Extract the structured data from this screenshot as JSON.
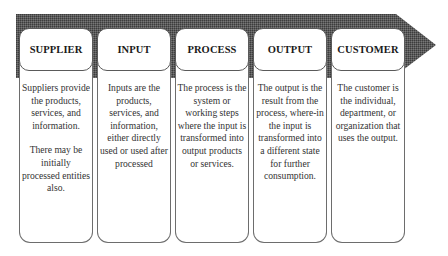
{
  "diagram": {
    "type": "SIPOC process flow",
    "arrow_color": "#4a4a4a",
    "columns": [
      {
        "title": "SUPPLIER",
        "paragraphs": [
          "Suppliers provide the products, services, and information.",
          "There may be initially processed entities also."
        ]
      },
      {
        "title": "INPUT",
        "paragraphs": [
          "Inputs are the products, services, and information, either directly used or used after processed"
        ]
      },
      {
        "title": "PROCESS",
        "paragraphs": [
          "The process is the system or working steps where the input is transformed into output products or services."
        ]
      },
      {
        "title": "OUTPUT",
        "paragraphs": [
          "The output is the result from the process, where-in the input is transformed into a different state for further consumption."
        ]
      },
      {
        "title": "CUSTOMER",
        "paragraphs": [
          "The customer is the individual, department, or organization that uses the output."
        ]
      }
    ]
  }
}
